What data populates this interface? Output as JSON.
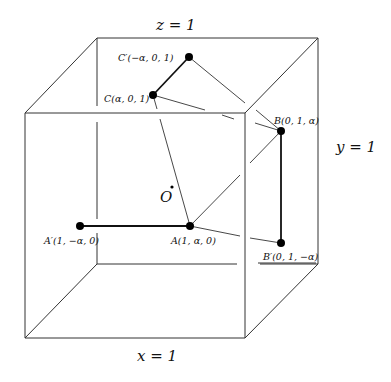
{
  "diagram": {
    "title": "",
    "plane_labels": {
      "z": "z = 1",
      "y": "y = 1",
      "x": "x = 1"
    },
    "origin_label": "O",
    "points": [
      {
        "id": "C_prime",
        "label": "C′(−α, 0, 1)",
        "x": 189,
        "y": 57
      },
      {
        "id": "C",
        "label": "C(α, 0, 1)",
        "x": 153,
        "y": 95
      },
      {
        "id": "B",
        "label": "B(0, 1, α)",
        "x": 281,
        "y": 131
      },
      {
        "id": "B_prime",
        "label": "B′(0, 1, −α)",
        "x": 281,
        "y": 243
      },
      {
        "id": "A",
        "label": "A(1, α, 0)",
        "x": 190,
        "y": 226
      },
      {
        "id": "A_prime",
        "label": "A′(1, −α, 0)",
        "x": 80,
        "y": 226
      }
    ],
    "segments": [
      {
        "from": "C_prime",
        "to": "C",
        "style": "thick"
      },
      {
        "from": "A_prime",
        "to": "A",
        "style": "thick"
      },
      {
        "from": "B",
        "to": "B_prime",
        "style": "thick"
      },
      {
        "from": "C",
        "to": "A",
        "style": "thin"
      },
      {
        "from": "C",
        "to": "B",
        "style": "thin"
      },
      {
        "from": "C_prime",
        "to": "B",
        "style": "thin"
      },
      {
        "from": "A",
        "to": "B",
        "style": "thin"
      },
      {
        "from": "A",
        "to": "B_prime",
        "style": "thin"
      }
    ],
    "colors": {
      "line": "#333333",
      "point": "#000000",
      "background": "#ffffff"
    }
  }
}
